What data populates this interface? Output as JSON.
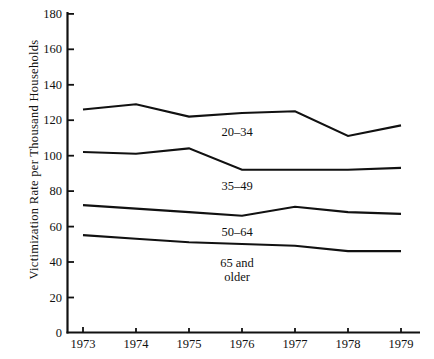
{
  "chart_data": {
    "type": "line",
    "title": "",
    "xlabel": "",
    "ylabel": "Victimization Rate per Thousand Households",
    "x": [
      1973,
      1974,
      1975,
      1976,
      1977,
      1978,
      1979
    ],
    "xtick_labels": [
      "1973",
      "1974",
      "1975",
      "1976",
      "1977",
      "1978",
      "1979"
    ],
    "ytick_labels": [
      "0",
      "20",
      "40",
      "60",
      "80",
      "100",
      "120",
      "140",
      "160",
      "180"
    ],
    "yticks": [
      0,
      20,
      40,
      60,
      80,
      100,
      120,
      140,
      160,
      180
    ],
    "ylim": [
      0,
      180
    ],
    "xlim": [
      1973,
      1979
    ],
    "grid": false,
    "legend": "inline-labels",
    "line_color": "#111111",
    "series": [
      {
        "name": "20-34",
        "label": "20–34",
        "values": [
          126,
          129,
          122,
          124,
          125,
          111,
          117
        ]
      },
      {
        "name": "35-49",
        "label": "35–49",
        "values": [
          102,
          101,
          104,
          92,
          92,
          92,
          93
        ]
      },
      {
        "name": "50-64",
        "label": "50–64",
        "values": [
          72,
          70,
          68,
          66,
          71,
          68,
          67
        ]
      },
      {
        "name": "65-and-older",
        "label": "65 and\nolder",
        "label_line1": "65 and",
        "label_line2": "older",
        "values": [
          55,
          53,
          51,
          50,
          49,
          46,
          46
        ]
      }
    ]
  }
}
